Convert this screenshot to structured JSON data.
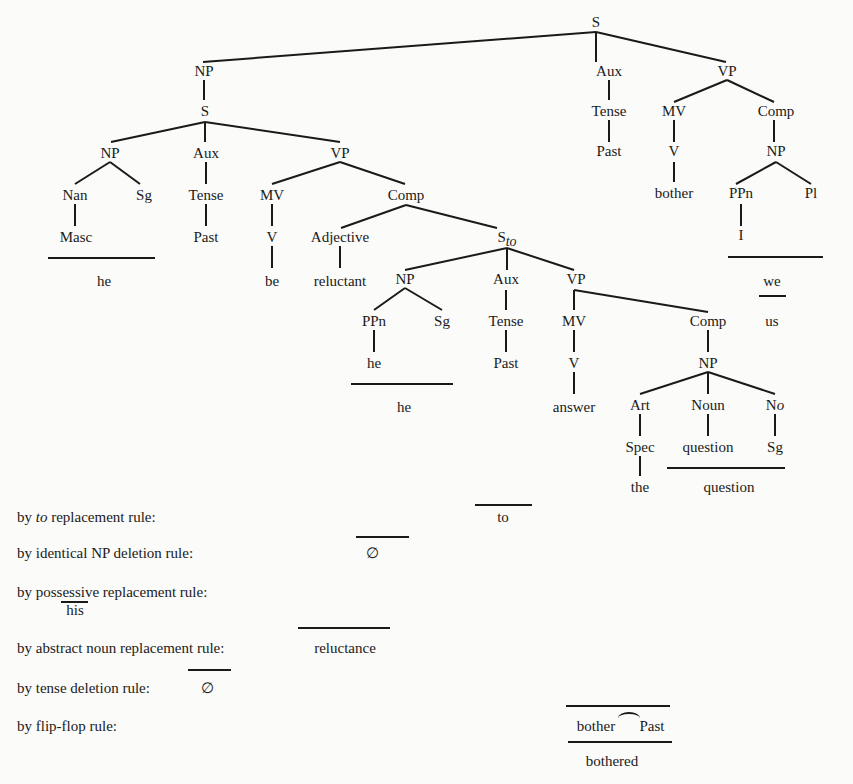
{
  "tree": {
    "root": "S",
    "matrix": {
      "np": "NP",
      "np_s": "S",
      "aux": "Aux",
      "tense": "Tense",
      "past": "Past",
      "vp": "VP",
      "mv": "MV",
      "v": "V",
      "verb": "bother",
      "comp": "Comp",
      "comp_np": "NP",
      "ppn": "PPn",
      "pl": "Pl",
      "pron": "I",
      "we": "we",
      "us": "us"
    },
    "embedded": {
      "np": "NP",
      "nan": "Nan",
      "sg": "Sg",
      "masc": "Masc",
      "he": "he",
      "aux": "Aux",
      "tense": "Tense",
      "past": "Past",
      "vp": "VP",
      "mv": "MV",
      "v": "V",
      "be": "be",
      "comp": "Comp",
      "adjective": "Adjective",
      "reluctant": "reluctant"
    },
    "sto": {
      "label_main": "S",
      "label_sub": "to",
      "np": "NP",
      "ppn": "PPn",
      "sg": "Sg",
      "he_lex": "he",
      "he": "he",
      "aux": "Aux",
      "tense": "Tense",
      "past": "Past",
      "vp": "VP",
      "mv": "MV",
      "v": "V",
      "answer": "answer",
      "comp": "Comp",
      "comp_np": "NP",
      "art": "Art",
      "spec": "Spec",
      "the": "the",
      "noun": "Noun",
      "question_lex": "question",
      "no_main": "N",
      "no_sub": "o",
      "question": "question"
    }
  },
  "rules": [
    {
      "prefix": "by ",
      "emph": "to",
      "suffix": " replacement rule:",
      "result": "to"
    },
    {
      "prefix": "by identical NP deletion rule:",
      "emph": "",
      "suffix": "",
      "result": "∅"
    },
    {
      "prefix": "by possessive replacement rule:",
      "emph": "",
      "suffix": "",
      "result": "his"
    },
    {
      "prefix": "by abstract noun replacement rule:",
      "emph": "",
      "suffix": "",
      "result": "reluctance"
    },
    {
      "prefix": "by tense deletion rule:",
      "emph": "",
      "suffix": "",
      "result": "∅"
    },
    {
      "prefix": "by flip-flop rule:",
      "emph": "",
      "suffix": "",
      "result_left": "bother",
      "result_right": "Past",
      "result_final": "bothered"
    }
  ]
}
